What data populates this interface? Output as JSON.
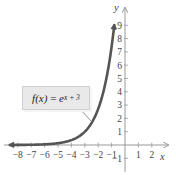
{
  "chart_data": {
    "type": "line",
    "title": "",
    "function_label": {
      "lhs": "f(x)",
      "eq": " = ",
      "base": "e",
      "exponent": "x + 3"
    },
    "xlabel": "x",
    "ylabel": "y",
    "xlim": [
      -8.5,
      2.8
    ],
    "ylim": [
      -1.8,
      9.8
    ],
    "x_ticks": [
      -8,
      -7,
      -6,
      -5,
      -4,
      -3,
      -2,
      -1,
      1,
      2
    ],
    "x_tick_labels": [
      "-8",
      "-7",
      "-6",
      "-5",
      "-4",
      "-3",
      "-2",
      "-1",
      "1",
      "2"
    ],
    "y_ticks": [
      -1,
      1,
      2,
      3,
      4,
      5,
      6,
      7,
      8,
      9
    ],
    "y_tick_labels": [
      "-1",
      "1",
      "2",
      "3",
      "4",
      "5",
      "6",
      "7",
      "8",
      "9"
    ],
    "grid": false,
    "series": [
      {
        "name": "f(x) = e^(x+3)",
        "color": "#555555",
        "x": [
          -8.5,
          -8,
          -7,
          -6,
          -5,
          -4,
          -3,
          -2.5,
          -2,
          -1.5,
          -1,
          -0.8
        ],
        "y": [
          0.004,
          0.007,
          0.018,
          0.05,
          0.135,
          0.368,
          1.0,
          1.649,
          2.718,
          4.482,
          7.389,
          9.025
        ]
      }
    ]
  },
  "colors": {
    "curve": "#555555",
    "axis": "#999999",
    "callout_bg": "#e9e9e9"
  }
}
